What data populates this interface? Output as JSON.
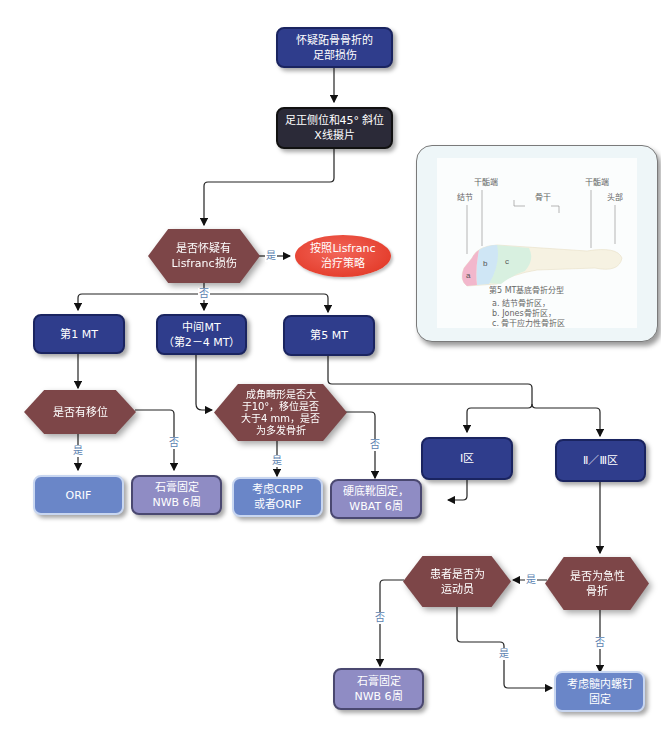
{
  "flowchart": {
    "start": "怀疑跖骨骨折的\n足部损伤",
    "xray": "足正侧位和45° 斜位\nX线摄片",
    "lisfranc_question": "是否怀疑有\nLisfranc损伤",
    "lisfranc_strategy": "按照Lisfranc\n治疗策略",
    "mt1": "第1 MT",
    "mt_middle": "中间MT\n（第2－4 MT）",
    "mt5": "第5 MT",
    "displaced_question": "是否有移位",
    "orif": "ORIF",
    "cast_nwb_1": "石膏固定\nNWB 6周",
    "angulation_question": "成角畸形是否大\n于10°，移位是否\n大于4 mm，是否\n为多发骨折",
    "crpp_or_orif": "考虑CRPP\n或者ORIF",
    "hard_shoe": "硬底靴固定，\nWBAT 6周",
    "zone1": "Ⅰ区",
    "zone23": "Ⅱ／Ⅲ区",
    "acute_question": "是否为急性\n骨折",
    "athlete_question": "患者是否为\n运动员",
    "cast_nwb_2": "石膏固定\nNWB 6周",
    "screw_fixation": "考虑髓内螺钉\n固定"
  },
  "edge_labels": {
    "yes": "是",
    "no": "否"
  },
  "anatomy_panel": {
    "labels": {
      "tuberosity": "结节",
      "metaphysis_left": "干骺端",
      "shaft": "骨干",
      "metaphysis_right": "干骺端",
      "head": "头部"
    },
    "zone_letters": [
      "a",
      "b",
      "c"
    ],
    "caption_title": "第5 MT基底骨折分型",
    "caption_items": [
      "a. 结节骨折区，",
      "b. Jones骨折区，",
      "c. 骨干应力性骨折区"
    ]
  },
  "colors": {
    "navy": "#2f3d8c",
    "black": "#2b2a38",
    "decision": "#7d4648",
    "lavender": "#8f8cc4",
    "blue": "#6a86c8",
    "red_oval": "#e5402f",
    "label_blue": "#5b7fb0"
  }
}
